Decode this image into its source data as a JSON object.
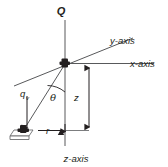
{
  "figure": {
    "kind": "technical-diagram",
    "background_color": "#ffffff",
    "line_color": "#58595b",
    "text_color": "#231f20"
  },
  "labels": {
    "source": "Q",
    "y_axis": "y-axis",
    "x_axis": "x-axis",
    "z_axis": "z-axis",
    "receiver": "q",
    "receiver_subscript": "v",
    "angle": "θ",
    "vertical_distance": "z",
    "radial_distance": "r"
  },
  "elements": {
    "origin_marker": "origin-point",
    "receiver_marker": "receiver-object",
    "angle_arc": "theta-arc",
    "z_dimension": "z-dimension-arrow",
    "r_dimension": "r-dimension-arrow",
    "q_arrow": "qv-pointer-arrow",
    "slant_line": "source-to-receiver-line"
  }
}
